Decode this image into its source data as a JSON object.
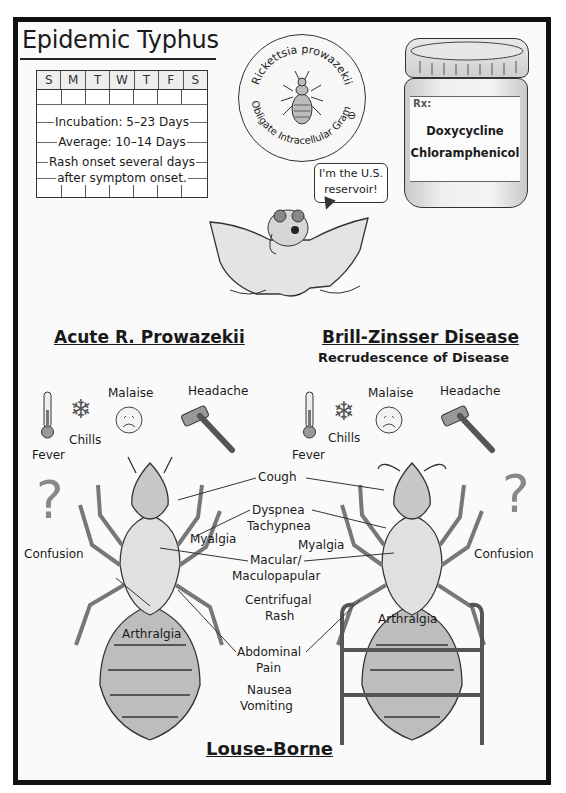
{
  "title": "Epidemic Typhus",
  "calendar": {
    "days": [
      "S",
      "M",
      "T",
      "W",
      "T",
      "F",
      "S"
    ],
    "lines": [
      "Incubation: 5–23 Days",
      "Average: 10–14 Days",
      "Rash onset several days",
      "after symptom onset."
    ]
  },
  "organism_badge": {
    "top_text": "Rickettsia prowazekii",
    "bottom_text": "Obligate Intracellular Gram",
    "gram_symbol": "⊖"
  },
  "treatment": {
    "rx_label": "Rx:",
    "drugs": [
      "Doxycycline",
      "Chloramphenicol"
    ]
  },
  "reservoir": {
    "speech_line1": "I'm the U.S.",
    "speech_line2": "reservoir!"
  },
  "acute": {
    "title": "Acute R. Prowazekii",
    "symptoms": {
      "fever": "Fever",
      "chills": "Chills",
      "malaise": "Malaise",
      "headache": "Headache",
      "confusion": "Confusion",
      "myalgia": "Myalgia",
      "arthralgia": "Arthralgia"
    }
  },
  "brill_zinsser": {
    "title": "Brill-Zinsser Disease",
    "subtitle": "Recrudescence of Disease",
    "symptoms": {
      "fever": "Fever",
      "chills": "Chills",
      "malaise": "Malaise",
      "headache": "Headache",
      "confusion": "Confusion",
      "myalgia": "Myalgia",
      "arthralgia": "Arthralgia"
    }
  },
  "shared_symptoms": {
    "cough": "Cough",
    "dyspnea": "Dyspnea",
    "tachypnea": "Tachypnea",
    "macular": "Macular/",
    "maculopapular": "Maculopapular",
    "centrifugal": "Centrifugal",
    "rash": "Rash",
    "abdominal": "Abdominal",
    "pain": "Pain",
    "nausea": "Nausea",
    "vomiting": "Vomiting"
  },
  "footer": {
    "transmission": "Louse-Borne"
  }
}
